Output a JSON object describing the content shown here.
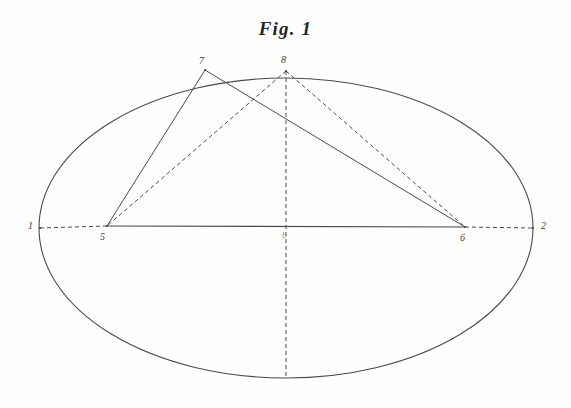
{
  "figure": {
    "title": "Fig. 1",
    "type": "geometric-diagram",
    "medium": "engraved-line-drawing",
    "background_color": "#fefefe",
    "ink_color": "#3a3a3a"
  },
  "canvas": {
    "width": 571,
    "height": 408
  },
  "ellipse": {
    "name": "main-ellipse",
    "center_x": 286,
    "center_y": 228,
    "radius_x": 247,
    "radius_y": 150,
    "stroke": "#4a4a4a",
    "stroke_width": 1.1,
    "style": "solid"
  },
  "points": [
    {
      "id": "1",
      "label": "1",
      "x": 40,
      "y": 228,
      "label_x": 28,
      "label_y": 221,
      "role": "left-vertex"
    },
    {
      "id": "2",
      "label": "2",
      "x": 533,
      "y": 228,
      "label_x": 541,
      "label_y": 221,
      "role": "right-vertex"
    },
    {
      "id": "5",
      "label": "5",
      "x": 107,
      "y": 226,
      "label_x": 100,
      "label_y": 232,
      "role": "left-focus"
    },
    {
      "id": "6",
      "label": "6",
      "x": 465,
      "y": 227,
      "label_x": 460,
      "label_y": 233,
      "role": "right-focus"
    },
    {
      "id": "7",
      "label": "7",
      "x": 205,
      "y": 70,
      "label_x": 199,
      "label_y": 56,
      "role": "upper-left-point"
    },
    {
      "id": "8",
      "label": "8",
      "x": 286,
      "y": 71,
      "label_x": 281,
      "label_y": 55,
      "role": "apex-point"
    },
    {
      "id": "c",
      "label": "b",
      "x": 286,
      "y": 228,
      "label_x": 282,
      "label_y": 231,
      "role": "center-mark"
    }
  ],
  "segments": [
    {
      "name": "segment-7-5",
      "from": "7",
      "to": "5",
      "style": "solid",
      "stroke": "#4a4a4a",
      "stroke_width": 1.0
    },
    {
      "name": "segment-7-6",
      "from": "7",
      "to": "6",
      "style": "solid",
      "stroke": "#4a4a4a",
      "stroke_width": 1.0
    },
    {
      "name": "segment-5-6",
      "from": "5",
      "to": "6",
      "style": "solid",
      "stroke": "#4a4a4a",
      "stroke_width": 1.2
    },
    {
      "name": "segment-8-5",
      "from": "8",
      "to": "5",
      "style": "dashed",
      "stroke": "#4a4a4a",
      "stroke_width": 1.0
    },
    {
      "name": "segment-8-6",
      "from": "8",
      "to": "6",
      "style": "dashed",
      "stroke": "#4a4a4a",
      "stroke_width": 1.0
    },
    {
      "name": "segment-1-5",
      "from": "1",
      "to": "5",
      "style": "dashed",
      "stroke": "#4a4a4a",
      "stroke_width": 1.0
    },
    {
      "name": "segment-6-2",
      "from": "6",
      "to": "2",
      "style": "dashed",
      "stroke": "#4a4a4a",
      "stroke_width": 1.0
    },
    {
      "name": "minor-axis-vertical",
      "from": "8",
      "to": "bottom",
      "style": "dashed",
      "stroke": "#4a4a4a",
      "stroke_width": 1.0,
      "bottom_x": 286,
      "bottom_y": 378
    }
  ],
  "dash_pattern": "4,3"
}
